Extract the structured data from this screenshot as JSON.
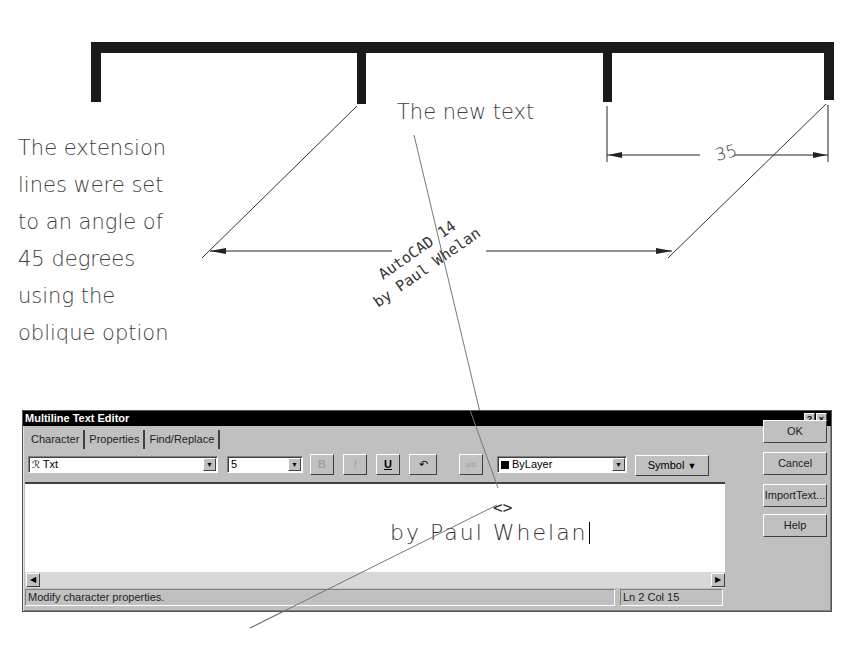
{
  "annotations": {
    "side_note_lines": [
      "The extension",
      "lines were set",
      "to an angle of",
      "45 degrees",
      "using the",
      "oblique option"
    ],
    "new_text_label": "The new text"
  },
  "drawing": {
    "horizontal_dimension": {
      "value": "35"
    },
    "oblique_dimension_text": {
      "line1": "AutoCAD 14",
      "line2": "by Paul Whelan"
    },
    "oblique_angle_degrees": 45
  },
  "dialog": {
    "title": "Multiline Text Editor",
    "help_button": "?",
    "close_button": "×",
    "tabs": [
      {
        "label": "Character",
        "active": true
      },
      {
        "label": "Properties",
        "active": false
      },
      {
        "label": "Find/Replace",
        "active": false
      }
    ],
    "font_select": {
      "value": "Txt"
    },
    "height_select": {
      "value": "5"
    },
    "format_buttons": [
      {
        "name": "bold",
        "label": "B",
        "enabled": false
      },
      {
        "name": "italic",
        "label": "I",
        "enabled": false
      },
      {
        "name": "underline",
        "label": "U",
        "enabled": true
      },
      {
        "name": "undo",
        "label": "↶",
        "enabled": true
      },
      {
        "name": "stack",
        "label": "a/b",
        "enabled": false
      }
    ],
    "color_select": {
      "value": "ByLayer",
      "swatch": "#000000"
    },
    "symbol_button": "Symbol",
    "side_buttons": {
      "ok": "OK",
      "cancel": "Cancel",
      "import": "ImportText...",
      "help": "Help"
    },
    "editor": {
      "line1": "<>",
      "line2": "by Paul Whelan"
    },
    "status": {
      "message": "Modify character properties.",
      "position": "Ln 2 Col 15"
    }
  }
}
